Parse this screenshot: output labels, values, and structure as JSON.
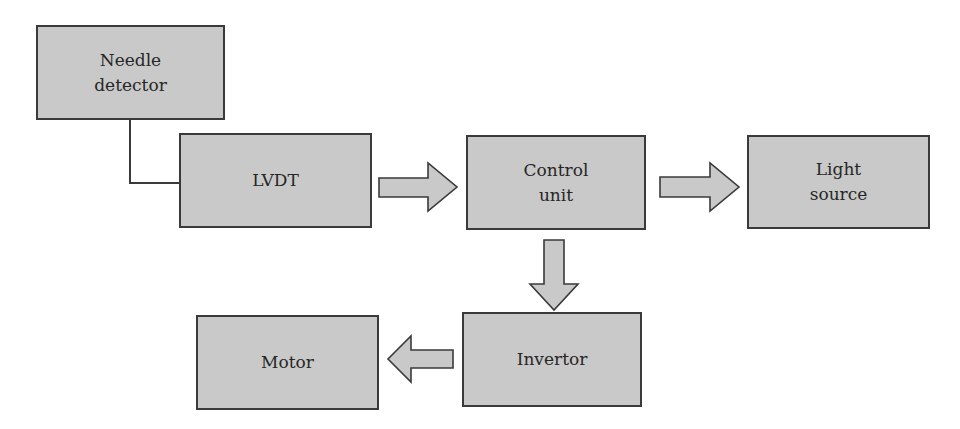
{
  "diagram": {
    "type": "block-diagram",
    "colors": {
      "box_fill": "#c9c9c9",
      "box_border": "#3a3a3a",
      "text": "#262626",
      "background": "#ffffff"
    },
    "nodes": [
      {
        "id": "needle_detector",
        "label": "Needle\ndetector"
      },
      {
        "id": "lvdt",
        "label": "LVDT"
      },
      {
        "id": "control_unit",
        "label": "Control\nunit"
      },
      {
        "id": "light_source",
        "label": "Light\nsource"
      },
      {
        "id": "invertor",
        "label": "Invertor"
      },
      {
        "id": "motor",
        "label": "Motor"
      }
    ],
    "edges": [
      {
        "from": "needle_detector",
        "to": "lvdt",
        "style": "line"
      },
      {
        "from": "lvdt",
        "to": "control_unit",
        "style": "block-arrow"
      },
      {
        "from": "control_unit",
        "to": "light_source",
        "style": "block-arrow"
      },
      {
        "from": "control_unit",
        "to": "invertor",
        "style": "block-arrow"
      },
      {
        "from": "invertor",
        "to": "motor",
        "style": "block-arrow"
      }
    ]
  }
}
